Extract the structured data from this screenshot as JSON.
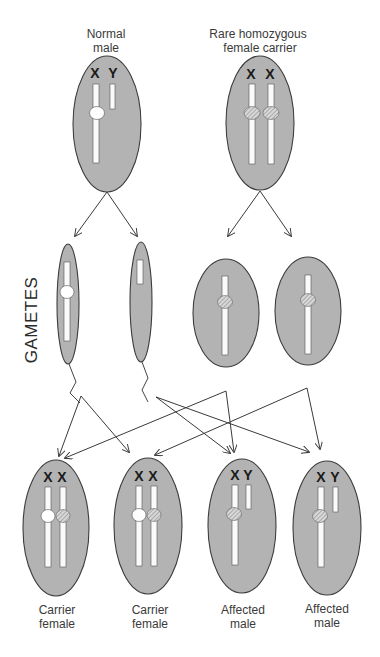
{
  "parents": [
    {
      "id": "normal-male",
      "label_lines": [
        "Normal",
        "male"
      ],
      "chromosomes": [
        "X",
        "Y"
      ]
    },
    {
      "id": "homozygous-female",
      "label_lines": [
        "Rare  homozygous",
        "female carrier"
      ],
      "chromosomes": [
        "X",
        "X"
      ]
    }
  ],
  "gametes": {
    "label": "GAMETES",
    "sperm": [
      {
        "id": "sperm-x",
        "chromosome": "X",
        "allele": "normal"
      },
      {
        "id": "sperm-y",
        "chromosome": "Y",
        "allele": "none"
      }
    ],
    "eggs": [
      {
        "id": "egg-1",
        "chromosome": "X",
        "allele": "mutant"
      },
      {
        "id": "egg-2",
        "chromosome": "X",
        "allele": "mutant"
      }
    ]
  },
  "offspring": [
    {
      "id": "offspring-1",
      "chromosomes": [
        "X",
        "X"
      ],
      "label_lines": [
        "Carrier",
        "female"
      ]
    },
    {
      "id": "offspring-2",
      "chromosomes": [
        "X",
        "X"
      ],
      "label_lines": [
        "Carrier",
        "female"
      ]
    },
    {
      "id": "offspring-3",
      "chromosomes": [
        "X",
        "Y"
      ],
      "label_lines": [
        "Affected",
        "male"
      ]
    },
    {
      "id": "offspring-4",
      "chromosomes": [
        "X",
        "Y"
      ],
      "label_lines": [
        "Affected",
        "male"
      ]
    }
  ],
  "legend": {
    "normal_allele": "white circle",
    "mutant_allele": "hatched circle"
  },
  "colors": {
    "cell_fill": "#b3b3b3",
    "cell_stroke": "#3c3c3c",
    "chromosome": "#fafafa"
  }
}
